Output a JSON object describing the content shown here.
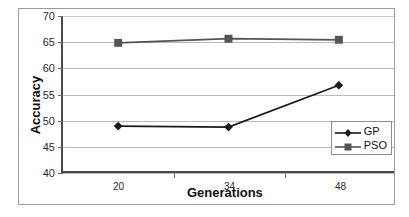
{
  "chart_data": {
    "type": "line",
    "title": "",
    "xlabel": "Generations",
    "ylabel": "Accuracy",
    "categories": [
      "20",
      "34",
      "48"
    ],
    "x": [
      20,
      34,
      48
    ],
    "ylim": [
      40,
      70
    ],
    "yticks": [
      40,
      45,
      50,
      55,
      60,
      65,
      70
    ],
    "ytick_labels": [
      "40",
      "45",
      "50",
      "55",
      "60",
      "65",
      "70"
    ],
    "grid": "horizontal",
    "legend_position": "bottom-right-inside",
    "series": [
      {
        "name": "GP",
        "marker": "diamond",
        "color": "#1a1a1a",
        "values": [
          48.7,
          48.5,
          56.6
        ]
      },
      {
        "name": "PSO",
        "marker": "square",
        "color": "#555555",
        "values": [
          64.8,
          65.6,
          65.4
        ]
      }
    ]
  },
  "legend": {
    "items": [
      {
        "label": "GP",
        "marker": "diamond-marker"
      },
      {
        "label": "PSO",
        "marker": "square-marker"
      }
    ]
  },
  "colors": {
    "gp_line": "#1a1a1a",
    "pso_line": "#555555",
    "gridline": "#b9b9b9",
    "axis": "#4a4a4a",
    "frame": "#9a9a9a",
    "text": "#2b2b2b"
  }
}
